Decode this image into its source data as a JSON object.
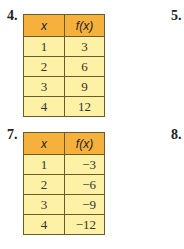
{
  "exercises": [
    {
      "label": "4.",
      "headers": [
        "x",
        "f(x)"
      ],
      "rows": [
        [
          "1",
          "3"
        ],
        [
          "2",
          "6"
        ],
        [
          "3",
          "9"
        ],
        [
          "4",
          "12"
        ]
      ]
    },
    {
      "label": "5."
    },
    {
      "label": "7.",
      "headers": [
        "x",
        "f(x)"
      ],
      "rows": [
        [
          "1",
          "−3"
        ],
        [
          "2",
          "−6"
        ],
        [
          "3",
          "−9"
        ],
        [
          "4",
          "−12"
        ]
      ]
    },
    {
      "label": "8."
    }
  ],
  "colors": {
    "header": "#f6b13c",
    "cell": "#fcf1a4",
    "border": "#6b5a2a"
  }
}
